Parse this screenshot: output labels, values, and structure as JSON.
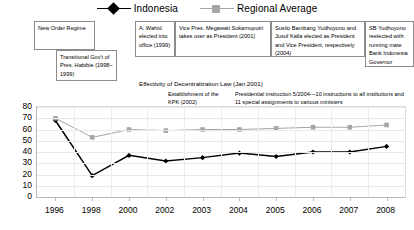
{
  "legend": {
    "items": [
      {
        "label": "Indonesia",
        "marker": "diamond-marker-icon",
        "color": "#000000"
      },
      {
        "label": "Regional Average",
        "marker": "square-marker-icon",
        "color": "#a6a6a6"
      }
    ]
  },
  "annotations": [
    {
      "name": "new-order-regime",
      "text": "New Order Regime"
    },
    {
      "name": "transitional-government",
      "text": "Transitional Gov't of Pres. Habibie (1998–1999)"
    },
    {
      "name": "wahid-elected",
      "text": "A. Wahid elected into office (1999)"
    },
    {
      "name": "megawati-president",
      "text": "Vice Pres. Megawati Sukarnoputri takes over as President (2001)"
    },
    {
      "name": "yudhoyono-kalla-elected",
      "text": "Susilo Bambang Yudhoyono and Jusuf Kalla elected as President and Vice President, respectively (2004)"
    },
    {
      "name": "yudhoyono-reelected",
      "text": "SB Yudhoyono reelected with running mate Bank Indonesia Governor Boediono (2009)"
    },
    {
      "name": "decentralization-law",
      "text": "Effectivity of Decentralization Law (Jan 2001)"
    },
    {
      "name": "kpk-establishment",
      "text": "Establishment of the KPK (2002)"
    },
    {
      "name": "presidential-instruction",
      "text": "Presidential instruction 5/2004—10 instructions to all institutions and 11 special assignments to various ministers"
    }
  ],
  "chart_data": {
    "type": "line",
    "title": "",
    "xlabel": "",
    "ylabel": "",
    "ylim": [
      0,
      80
    ],
    "yticks": [
      0,
      10,
      20,
      30,
      40,
      50,
      60,
      70,
      80
    ],
    "grid": true,
    "legend_position": "top-center",
    "categories": [
      "1996",
      "1998",
      "2000",
      "2002",
      "2003",
      "2004",
      "2005",
      "2006",
      "2007",
      "2008"
    ],
    "series": [
      {
        "name": "Indonesia",
        "color": "#000000",
        "marker": "diamond",
        "values": [
          68,
          19,
          37,
          32,
          35,
          39,
          36,
          40,
          40,
          45
        ]
      },
      {
        "name": "Regional Average",
        "color": "#a6a6a6",
        "marker": "square",
        "values": [
          70,
          53,
          60,
          59,
          60,
          60,
          61,
          62,
          62,
          64
        ]
      }
    ]
  }
}
